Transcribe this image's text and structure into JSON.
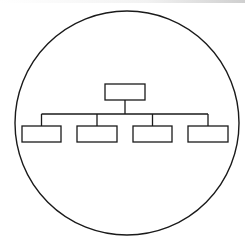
{
  "diagram": {
    "type": "hierarchy-icon",
    "colors": {
      "stroke": "#1a1a1a",
      "background": "#ffffff"
    },
    "circle": {
      "cx": 127,
      "cy": 123,
      "r": 112
    },
    "root": {
      "x": 105,
      "y": 84,
      "w": 40,
      "h": 16,
      "label": ""
    },
    "bus_y": 114,
    "children": [
      {
        "x": 22,
        "y": 126,
        "w": 39,
        "h": 16,
        "label": ""
      },
      {
        "x": 77,
        "y": 126,
        "w": 40,
        "h": 16,
        "label": ""
      },
      {
        "x": 133,
        "y": 126,
        "w": 39,
        "h": 16,
        "label": ""
      },
      {
        "x": 188,
        "y": 126,
        "w": 40,
        "h": 16,
        "label": ""
      }
    ]
  }
}
